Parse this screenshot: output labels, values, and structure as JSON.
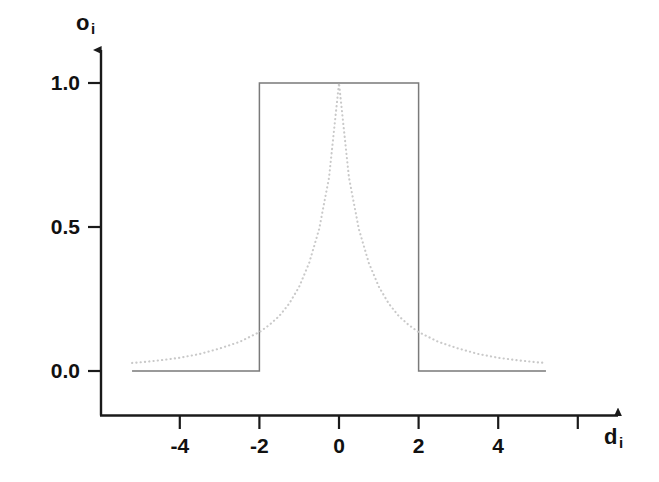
{
  "figure": {
    "background_color": "#ffffff",
    "axis_color": "#1a1a1a",
    "curve_color": "#7a7a7a",
    "dotted_color": "#c9c9c9"
  },
  "axes": {
    "y_label": "o",
    "y_label_sub": "i",
    "x_label": "d",
    "x_label_sub": "i",
    "y_ticks": [
      {
        "value": 1.0,
        "label": "1.0"
      },
      {
        "value": 0.5,
        "label": "0.5"
      },
      {
        "value": 0.0,
        "label": "0.0"
      }
    ],
    "x_ticks": [
      {
        "value": -4,
        "label": "-4"
      },
      {
        "value": -2,
        "label": "-2"
      },
      {
        "value": 0,
        "label": "0"
      },
      {
        "value": 2,
        "label": "2"
      },
      {
        "value": 4,
        "label": "4"
      },
      {
        "value": 6,
        "label": ""
      }
    ]
  },
  "chart_data": {
    "type": "line",
    "title": "",
    "xlabel": "d_i",
    "ylabel": "o_i",
    "xlim": [
      -5.4,
      7.0
    ],
    "ylim": [
      0.0,
      1.08
    ],
    "grid": false,
    "legend": "none",
    "series": [
      {
        "name": "step (rectangular membership)",
        "style": "solid",
        "color": "#7a7a7a",
        "x": [
          -5.2,
          -2.0,
          -2.0,
          2.0,
          2.0,
          5.2
        ],
        "values": [
          0.0,
          0.0,
          1.0,
          1.0,
          0.0,
          0.0
        ]
      },
      {
        "name": "smooth (bell / Cauchy membership)",
        "style": "dotted",
        "color": "#c9c9c9",
        "x": [
          -5.2,
          -5.0,
          -4.5,
          -4.0,
          -3.5,
          -3.0,
          -2.5,
          -2.0,
          -1.75,
          -1.5,
          -1.25,
          -1.0,
          -0.75,
          -0.5,
          -0.25,
          0.0,
          0.25,
          0.5,
          0.75,
          1.0,
          1.25,
          1.5,
          1.75,
          2.0,
          2.5,
          3.0,
          3.5,
          4.0,
          4.5,
          5.0,
          5.2
        ],
        "values": [
          0.028,
          0.03,
          0.037,
          0.046,
          0.059,
          0.078,
          0.101,
          0.135,
          0.16,
          0.191,
          0.234,
          0.293,
          0.375,
          0.492,
          0.672,
          1.0,
          0.672,
          0.492,
          0.375,
          0.293,
          0.234,
          0.191,
          0.16,
          0.135,
          0.101,
          0.078,
          0.059,
          0.046,
          0.037,
          0.03,
          0.028
        ]
      }
    ]
  }
}
